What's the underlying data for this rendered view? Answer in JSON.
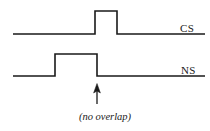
{
  "figure": {
    "background_color": "#ffffff",
    "stroke_color": "#1a1a1a",
    "width": 210,
    "height": 131
  },
  "traces": [
    {
      "name": "CS",
      "label": "CS",
      "label_x": 180,
      "label_y": 23,
      "baseline_y": 34,
      "pulse_top_y": 11,
      "x_start": 13,
      "x_end": 205,
      "pulse_start_x": 95,
      "pulse_end_x": 117,
      "pulse_amplitude": 23
    },
    {
      "name": "NS",
      "label": "NS",
      "label_x": 181,
      "label_y": 65,
      "baseline_y": 76,
      "pulse_top_y": 54,
      "x_start": 13,
      "x_end": 205,
      "pulse_start_x": 55,
      "pulse_end_x": 97,
      "pulse_amplitude": 22
    }
  ],
  "annotation": {
    "caption": "(no overlap)",
    "caption_style": "italic",
    "arrow": {
      "name": "up-arrow",
      "x": 97,
      "tip_y": 84,
      "tail_y": 104,
      "head_width": 7,
      "head_height": 9,
      "points_to": "NS falling edge"
    }
  },
  "colors": {
    "stroke": "#1a1a1a",
    "background": "#ffffff",
    "text": "#1a1a1a"
  }
}
